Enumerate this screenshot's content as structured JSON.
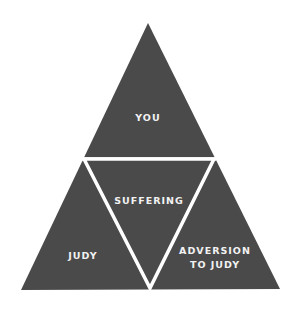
{
  "diagram": {
    "type": "triangle-of-four",
    "colors": {
      "fill": "#4a4a4a",
      "divider": "#ffffff",
      "label": "#f2f2f2",
      "background": "#ffffff"
    },
    "sections": {
      "top": {
        "label": "YOU"
      },
      "center": {
        "label": "SUFFERING"
      },
      "bottom_left": {
        "label": "JUDY"
      },
      "bottom_right": {
        "label_line1": "ADVERSION",
        "label_line2": "TO JUDY"
      }
    }
  }
}
